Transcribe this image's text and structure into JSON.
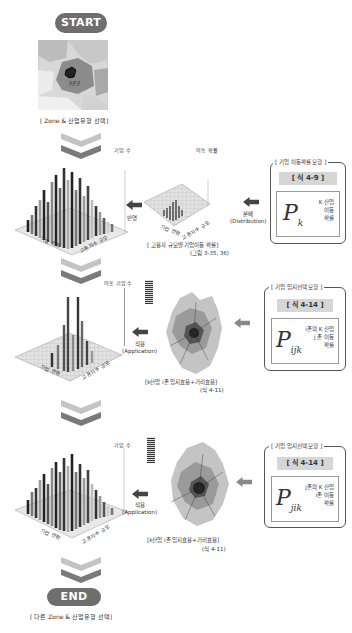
{
  "start": {
    "label": "START",
    "caption": "[ Zone & 산업유형 선택]",
    "map_label": "구로구"
  },
  "end": {
    "label": "END",
    "caption": "[ 다른 Zone & 산업유형 선택]"
  },
  "colors": {
    "pill": "#6e6e6e",
    "chevron_light": "#c4c4c4",
    "chevron_dark": "#7a7a7a",
    "arrow": "#444444",
    "eq_tag": "#d6d6d6"
  },
  "stage1": {
    "left_chart": {
      "axis_z": "기업 수",
      "axis_x": "기업 연령",
      "axis_y": "고용자수 규모"
    },
    "right_chart": {
      "axis_z": "이동 확률",
      "axis_x": "기업 연령",
      "axis_y": "고용자수 규모"
    },
    "arrow_left_label": "반영",
    "arrow_right_label_1": "분배",
    "arrow_right_label_2": "(Distribution)",
    "caption_1": "[ 고용자 규모별 기업이동 확률]",
    "caption_2": "(그림 3-35, 36)",
    "model": {
      "title": "[ 기업 이동확률 모형 ]",
      "eq": "[ 식 4-9 ]",
      "symbol": "P",
      "sub": "k",
      "text": [
        "K 산업",
        "이동",
        "확률"
      ]
    }
  },
  "stage2": {
    "chart": {
      "axis_z": "이동 기업 수",
      "axis_x": "기업 연령",
      "axis_y": "고용자수 규모"
    },
    "arrow_label_1": "적용",
    "arrow_label_2": "(Application)",
    "caption_1": "[k산업 i존 입지효용+거리효용]",
    "caption_2": "(식 4-11)",
    "model": {
      "title": "[ 기업 입지선택 모형 ]",
      "eq": "[ 식 4-14 ]",
      "symbol": "P",
      "sub": "ijk",
      "text": [
        "i존의 K 산업",
        "j 존 이동",
        "확률"
      ]
    }
  },
  "stage3": {
    "chart": {
      "axis_z": "기업 수",
      "axis_x": "기업 연령",
      "axis_y": "고용자수 규모"
    },
    "arrow_label_1": "적용",
    "arrow_label_2": "(Application)",
    "caption_1": "[k산업 i존 입지효용+거리효용]",
    "caption_2": "(식 4-11)",
    "model": {
      "title": "[ 기업 입지선택 모형 ]",
      "eq": "[ 식 4-14 ]",
      "symbol": "P",
      "sub": "jik",
      "text": [
        "j존의 K 산업",
        "i존 이동",
        "확률"
      ]
    }
  }
}
